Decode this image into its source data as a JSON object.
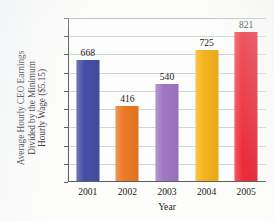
{
  "chart_data": {
    "type": "bar",
    "title": "",
    "categories": [
      "2001",
      "2002",
      "2003",
      "2004",
      "2005"
    ],
    "values": [
      668,
      416,
      540,
      725,
      821
    ],
    "bar_colors": [
      "#4450a6",
      "#ec7a26",
      "#a077c2",
      "#f5b41c",
      "#ee2c3a"
    ],
    "xlabel": "Year",
    "ylabel": "Average Hourly CEO Earnings Divided by the Minimum Hourly Wage ($5.15)",
    "ylabel_lines": [
      "Average Hourly CEO Earnings",
      "Divided by the Minimum",
      "Hourly Wage ($5.15)"
    ],
    "ylim": [
      0,
      900
    ],
    "ytick_labels": [
      "0",
      "100",
      "200",
      "300",
      "400",
      "500",
      "600",
      "700",
      "800",
      "900"
    ],
    "ytick_values": [
      0,
      100,
      200,
      300,
      400,
      500,
      600,
      700,
      800,
      900
    ],
    "grid": true,
    "grid_color": "#ccd6e2",
    "legend": "none",
    "data_labels": [
      "668",
      "416",
      "540",
      "725",
      "821"
    ],
    "axis_color": "#5d5d63",
    "background": "#fdfdfb"
  }
}
